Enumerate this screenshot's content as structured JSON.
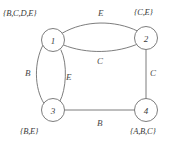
{
  "diagram": {
    "type": "undirected-multigraph",
    "background_color": "#ffffff",
    "stroke_color": "#6e6e6e",
    "text_color": "#3b3b3b",
    "nodes": [
      {
        "id": "1",
        "label": "1",
        "cx": 53,
        "cy": 40,
        "r": 11.5,
        "set_label": "{B,C,D,E}",
        "set_position": "top-left"
      },
      {
        "id": "2",
        "label": "2",
        "cx": 146,
        "cy": 38,
        "r": 11.5,
        "set_label": "{C,E}",
        "set_position": "top-right"
      },
      {
        "id": "3",
        "label": "3",
        "cx": 53,
        "cy": 110,
        "r": 11.5,
        "set_label": "{B,E}",
        "set_position": "bottom-left"
      },
      {
        "id": "4",
        "label": "4",
        "cx": 146,
        "cy": 110,
        "r": 11.5,
        "set_label": "{A,B,C}",
        "set_position": "bottom-right"
      }
    ],
    "edges": [
      {
        "id": "e1",
        "from": "1",
        "to": "2",
        "label": "E",
        "shape": "curve-up",
        "label_x": 98,
        "label_y": 9
      },
      {
        "id": "e2",
        "from": "1",
        "to": "2",
        "label": "C",
        "shape": "curve-down",
        "label_x": 97,
        "label_y": 57
      },
      {
        "id": "e3",
        "from": "1",
        "to": "3",
        "label": "B",
        "shape": "curve-left",
        "label_x": 25,
        "label_y": 69
      },
      {
        "id": "e4",
        "from": "1",
        "to": "3",
        "label": "E",
        "shape": "curve-right",
        "label_x": 66,
        "label_y": 73
      },
      {
        "id": "e5",
        "from": "2",
        "to": "4",
        "label": "C",
        "shape": "straight",
        "label_x": 150,
        "label_y": 69
      },
      {
        "id": "e6",
        "from": "3",
        "to": "4",
        "label": "B",
        "shape": "straight",
        "label_x": 97,
        "label_y": 119
      }
    ],
    "set_labels": [
      {
        "id": "s1",
        "text": "{B,C,D,E}",
        "x": 3,
        "y": 9
      },
      {
        "id": "s2",
        "text": "{C,E}",
        "x": 134,
        "y": 8
      },
      {
        "id": "s3",
        "text": "{B,E}",
        "x": 20,
        "y": 127
      },
      {
        "id": "s4",
        "text": "{A,B,C}",
        "x": 130,
        "y": 127
      }
    ]
  }
}
